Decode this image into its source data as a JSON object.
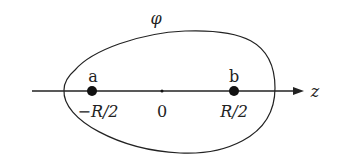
{
  "diagram": {
    "type": "electrostatics-schematic",
    "curve_label": "φ",
    "axis_label": "z",
    "points": [
      {
        "name": "a",
        "position_label": "−R/2"
      },
      {
        "name": "b",
        "position_label": "R/2"
      }
    ],
    "origin_label": "0",
    "colors": {
      "stroke": "#222222",
      "background": "#ffffff"
    }
  }
}
